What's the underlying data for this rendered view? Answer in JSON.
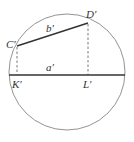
{
  "diagram": {
    "type": "geometry",
    "colors": {
      "stroke": "#333333",
      "circle": "#666666",
      "background": "#ffffff"
    },
    "circle": {
      "cx": 67,
      "cy": 72,
      "r": 58
    },
    "points": {
      "C": {
        "label": "C′",
        "x": 17,
        "y": 46
      },
      "D": {
        "label": "D′",
        "x": 88,
        "y": 23
      },
      "K": {
        "label": "K′",
        "x": 17,
        "y": 75
      },
      "L": {
        "label": "L′",
        "x": 88,
        "y": 75
      }
    },
    "segments": {
      "a": {
        "label": "a′",
        "from": "diameter-left",
        "to": "diameter-right",
        "style": "solid"
      },
      "b": {
        "label": "b′",
        "from": "C",
        "to": "D",
        "style": "solid"
      },
      "CK": {
        "from": "C",
        "to": "K",
        "style": "dashed"
      },
      "DL": {
        "from": "D",
        "to": "L",
        "style": "dashed"
      }
    },
    "labels": {
      "C": "C′",
      "D": "D′",
      "K": "K′",
      "L": "L′",
      "a": "a′",
      "b": "b′"
    }
  }
}
